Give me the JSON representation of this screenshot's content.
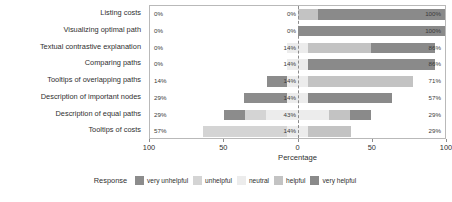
{
  "chart_data": {
    "type": "bar",
    "subtype": "diverging-stacked-likert",
    "title": "",
    "xlabel": "Percentage",
    "ylabel": "",
    "xlim": [
      -100,
      100
    ],
    "xticks": [
      -100,
      -50,
      0,
      50,
      100
    ],
    "xtick_labels": [
      "100",
      "50",
      "0",
      "50",
      "100"
    ],
    "grid": false,
    "legend_position": "bottom",
    "legend_title": "Response",
    "categories": [
      "Listing costs",
      "Visualizing optimal path",
      "Textual contrastive explanation",
      "Comparing paths",
      "Tooltips of overlapping paths",
      "Description of important nodes",
      "Description of equal paths",
      "Tooltips of costs"
    ],
    "series": [
      {
        "name": "very unhelpful",
        "color": "#8c8c8c",
        "values": [
          0,
          0,
          0,
          0,
          14,
          29,
          14,
          0
        ]
      },
      {
        "name": "unhelpful",
        "color": "#d4d4d4",
        "values": [
          0,
          0,
          0,
          0,
          0,
          0,
          14,
          57
        ]
      },
      {
        "name": "neutral",
        "color": "#ececec",
        "values": [
          0,
          0,
          14,
          14,
          14,
          14,
          43,
          14
        ]
      },
      {
        "name": "helpful",
        "color": "#c3c3c3",
        "values": [
          14,
          0,
          43,
          0,
          71,
          0,
          14,
          29
        ]
      },
      {
        "name": "very helpful",
        "color": "#8a8a8a",
        "values": [
          86,
          100,
          43,
          86,
          0,
          57,
          14,
          0
        ]
      }
    ],
    "negative_labels": [
      "0%",
      "0%",
      "0%",
      "0%",
      "14%",
      "29%",
      "29%",
      "57%"
    ],
    "neutral_labels": [
      "0%",
      "0%",
      "14%",
      "14%",
      "14%",
      "14%",
      "43%",
      "14%"
    ],
    "positive_labels": [
      "100%",
      "100%",
      "86%",
      "86%",
      "71%",
      "57%",
      "29%",
      "29%"
    ]
  },
  "legend": {
    "title": "Response",
    "items": [
      {
        "label": "very unhelpful",
        "color": "#8c8c8c"
      },
      {
        "label": "unhelpful",
        "color": "#d4d4d4"
      },
      {
        "label": "neutral",
        "color": "#ececec"
      },
      {
        "label": "helpful",
        "color": "#c3c3c3"
      },
      {
        "label": "very helpful",
        "color": "#8a8a8a"
      }
    ]
  },
  "axis": {
    "title": "Percentage",
    "tick_labels": [
      "100",
      "50",
      "0",
      "50",
      "100"
    ]
  }
}
